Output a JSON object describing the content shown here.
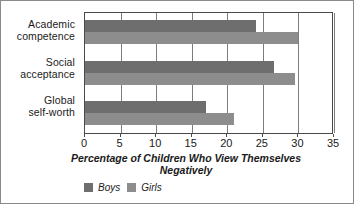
{
  "chart_data": {
    "type": "bar",
    "orientation": "horizontal",
    "title": "",
    "xlabel": "Percentage of Children Who View Themselves Negatively",
    "xlabel_line1": "Percentage of Children Who View Themselves",
    "xlabel_line2": "Negatively",
    "ylabel": "",
    "categories": [
      "Academic competence",
      "Social acceptance",
      "Global self-worth"
    ],
    "category_lines": [
      [
        "Academic",
        "competence"
      ],
      [
        "Social",
        "acceptance"
      ],
      [
        "Global",
        "self-worth"
      ]
    ],
    "series": [
      {
        "name": "Boys",
        "color": "#6e6e6e",
        "values": [
          24,
          26.5,
          17
        ]
      },
      {
        "name": "Girls",
        "color": "#8d8d8d",
        "values": [
          30,
          29.5,
          21
        ]
      }
    ],
    "xlim": [
      0,
      35
    ],
    "xticks": [
      0,
      5,
      10,
      15,
      20,
      25,
      30,
      35
    ],
    "xtick_labels": [
      "0",
      "5",
      "10",
      "15",
      "20",
      "25",
      "30",
      "35"
    ],
    "grid": true,
    "grid_axis": "x",
    "legend_position": "bottom-left",
    "legend_entries": [
      "Boys",
      "Girls"
    ]
  },
  "colors": {
    "boys": "#6e6e6e",
    "girls": "#8d8d8d",
    "axis": "#4a4a4a",
    "grid": "#7d7d7d",
    "text": "#1a1a1a",
    "frame": "#8a8a8a",
    "background": "#ffffff"
  }
}
